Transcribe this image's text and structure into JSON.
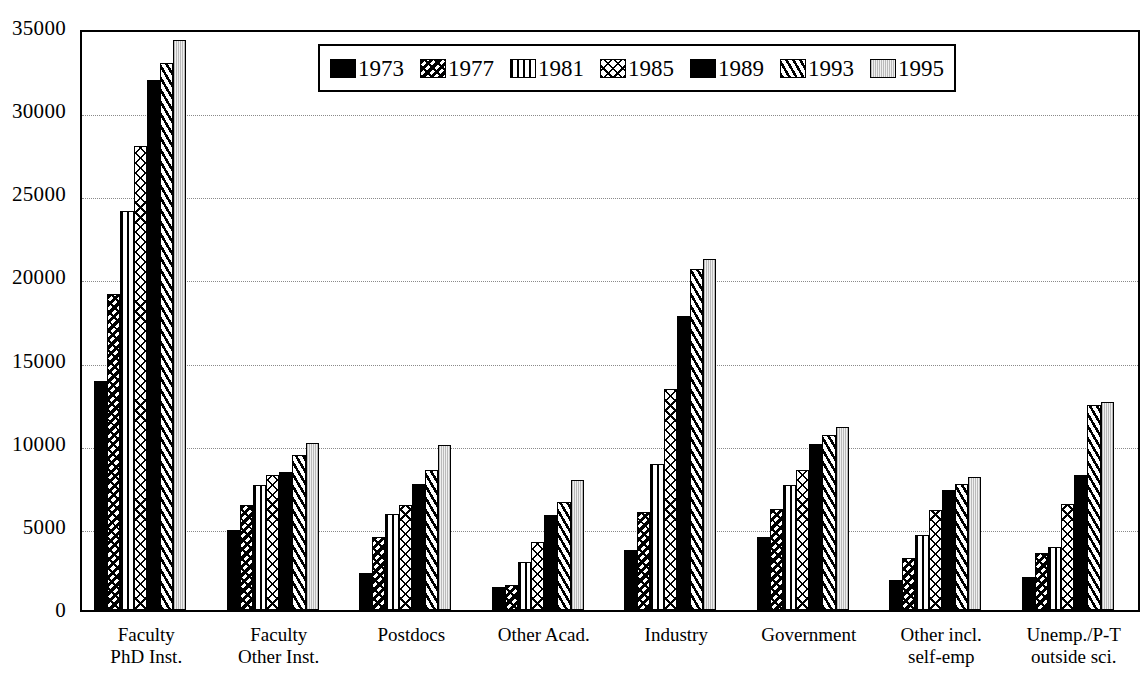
{
  "chart_data": {
    "type": "bar",
    "title": "",
    "subtitle": "",
    "xlabel": "",
    "ylabel": "",
    "ylim": [
      0,
      35000
    ],
    "ytick_labels": [
      "35000",
      "30000",
      "25000",
      "20000",
      "15000",
      "10000",
      "5000",
      "0"
    ],
    "ytick_values": [
      35000,
      30000,
      25000,
      20000,
      15000,
      10000,
      5000,
      0
    ],
    "grid": true,
    "grid_axis": "y",
    "legend_position": "top-center",
    "categories": [
      "Faculty PhD Inst.",
      "Faculty Other Inst.",
      "Postdocs",
      "Other Acad.",
      "Industry",
      "Government",
      "Other incl. self-emp",
      "Unemp./P-T outside sci."
    ],
    "category_lines": [
      [
        "Faculty",
        "PhD Inst."
      ],
      [
        "Faculty",
        "Other Inst."
      ],
      [
        "Postdocs",
        ""
      ],
      [
        "Other Acad.",
        ""
      ],
      [
        "Industry",
        ""
      ],
      [
        "Government",
        ""
      ],
      [
        "Other incl.",
        "self-emp"
      ],
      [
        "Unemp./P-T",
        "outside sci."
      ]
    ],
    "series": [
      {
        "name": "1973",
        "pattern": "solid-black",
        "values": [
          13800,
          4800,
          2200,
          1400,
          3600,
          4400,
          1800,
          2000
        ]
      },
      {
        "name": "1977",
        "pattern": "sparse-marks",
        "values": [
          19000,
          6300,
          4400,
          1500,
          5900,
          6100,
          3100,
          3400
        ]
      },
      {
        "name": "1981",
        "pattern": "vertical-lines",
        "values": [
          24000,
          7500,
          5800,
          2900,
          8800,
          7500,
          4500,
          3800
        ]
      },
      {
        "name": "1985",
        "pattern": "cross-hatch",
        "values": [
          27900,
          8100,
          6300,
          4100,
          13300,
          8400,
          6000,
          6400
        ]
      },
      {
        "name": "1989",
        "pattern": "solid-black",
        "values": [
          31900,
          8300,
          7600,
          5700,
          17700,
          10000,
          7200,
          8100
        ]
      },
      {
        "name": "1993",
        "pattern": "diagonal-lines",
        "values": [
          32900,
          9300,
          8400,
          6500,
          20500,
          10500,
          7600,
          12300
        ]
      },
      {
        "name": "1995",
        "pattern": "light-dotted",
        "values": [
          34300,
          10050,
          9900,
          7800,
          21100,
          11000,
          8000,
          12500
        ]
      }
    ]
  },
  "legend": {
    "items": [
      {
        "label": "1973",
        "pattern": "solid-black"
      },
      {
        "label": "1977",
        "pattern": "sparse-marks"
      },
      {
        "label": "1981",
        "pattern": "vertical-lines"
      },
      {
        "label": "1985",
        "pattern": "cross-hatch"
      },
      {
        "label": "1989",
        "pattern": "solid-black"
      },
      {
        "label": "1993",
        "pattern": "diagonal-lines"
      },
      {
        "label": "1995",
        "pattern": "light-dotted"
      }
    ]
  },
  "colors": {
    "background": "#ffffff",
    "foreground": "#000000",
    "gridline": "#8a8a8a",
    "light_fill": "#e2e2e2"
  }
}
